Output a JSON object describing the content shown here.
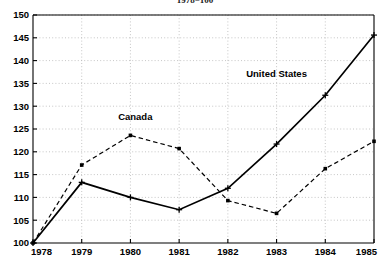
{
  "chart_data": {
    "type": "line",
    "title": "1978=100",
    "xlabel": "",
    "ylabel": "",
    "x": [
      1978,
      1979,
      1980,
      1981,
      1982,
      1983,
      1984,
      1985
    ],
    "xtick_labels": [
      "1978",
      "1979",
      "1980",
      "1981",
      "1982",
      "1983",
      "1984",
      "1985"
    ],
    "ytick_labels": [
      "100",
      "105",
      "110",
      "115",
      "120",
      "125",
      "130",
      "135",
      "140",
      "145",
      "150"
    ],
    "yticks": [
      100,
      105,
      110,
      115,
      120,
      125,
      130,
      135,
      140,
      145,
      150
    ],
    "xlim": [
      1978,
      1985
    ],
    "ylim": [
      100,
      150
    ],
    "grid": true,
    "grid_style": "dotted",
    "legend": "inline-annotations",
    "series": [
      {
        "name": "United States",
        "line_style": "solid",
        "marker": "cross",
        "color": "#000000",
        "label_x": 1983.0,
        "label_y": 136.5,
        "values": [
          100.0,
          113.3,
          110.0,
          107.3,
          112.0,
          121.7,
          132.4,
          145.6
        ]
      },
      {
        "name": "Canada",
        "line_style": "dashed",
        "marker": "square",
        "color": "#000000",
        "label_x": 1980.1,
        "label_y": 126.9,
        "values": [
          100.0,
          117.1,
          123.6,
          120.7,
          109.3,
          106.5,
          116.3,
          122.3
        ]
      }
    ]
  },
  "colors": {
    "axis": "#000000",
    "grid": "#b8b8b8",
    "background": "#ffffff",
    "series_us": "#000000",
    "series_canada": "#000000"
  }
}
